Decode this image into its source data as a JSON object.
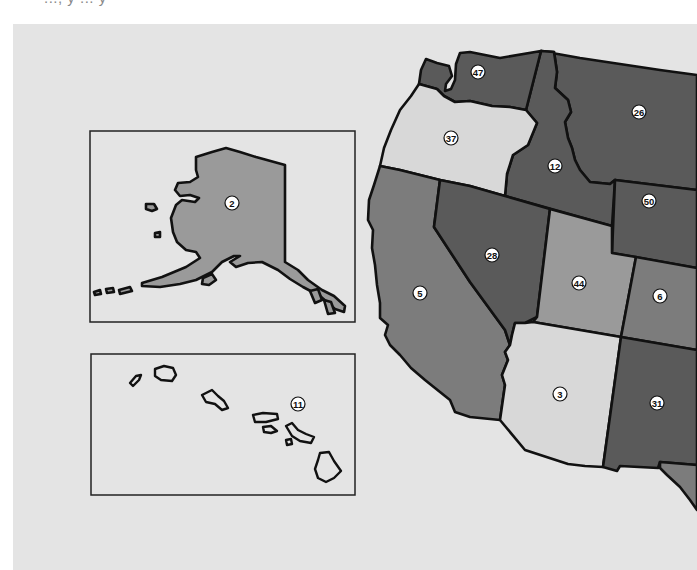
{
  "header": {
    "cut_off_caption": "..., y ... y"
  },
  "legend_colors": {
    "background": "#e4e4e4",
    "light": "#d8d8d8",
    "medium": "#7c7c7c",
    "medium_light": "#9a9a9a",
    "dark": "#5a5a5a"
  },
  "states": {
    "washington": {
      "name": "Washington",
      "rank": "47"
    },
    "oregon": {
      "name": "Oregon",
      "rank": "37"
    },
    "idaho": {
      "name": "Idaho",
      "rank": "12"
    },
    "montana": {
      "name": "Montana",
      "rank": "26"
    },
    "wyoming": {
      "name": "Wyoming",
      "rank": "50"
    },
    "california": {
      "name": "California",
      "rank": "5"
    },
    "nevada": {
      "name": "Nevada",
      "rank": "28"
    },
    "utah": {
      "name": "Utah",
      "rank": "44"
    },
    "colorado": {
      "name": "Colorado",
      "rank": "6"
    },
    "arizona": {
      "name": "Arizona",
      "rank": "3"
    },
    "new_mexico": {
      "name": "New Mexico",
      "rank": "31"
    },
    "texas": {
      "name": "Texas",
      "rank": ""
    }
  },
  "insets": {
    "alaska": {
      "name": "Alaska",
      "rank": "2"
    },
    "hawaii": {
      "name": "Hawaii",
      "rank": "11"
    }
  }
}
